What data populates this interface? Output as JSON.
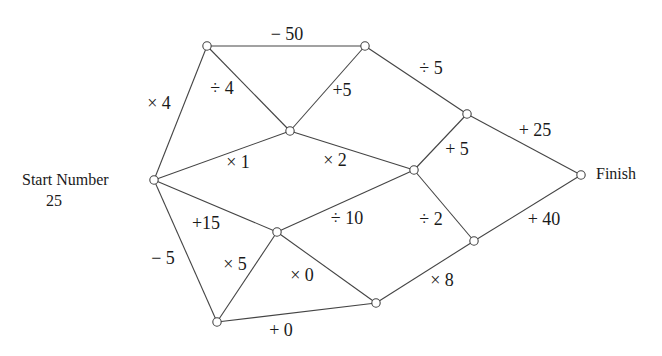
{
  "labels": {
    "start_title": "Start Number",
    "start_value": "25",
    "finish": "Finish"
  },
  "nodes": [
    {
      "id": "start",
      "x": 154,
      "y": 180
    },
    {
      "id": "A",
      "x": 207,
      "y": 46
    },
    {
      "id": "B",
      "x": 365,
      "y": 46
    },
    {
      "id": "C",
      "x": 290,
      "y": 131
    },
    {
      "id": "D",
      "x": 467,
      "y": 114
    },
    {
      "id": "E",
      "x": 414,
      "y": 170
    },
    {
      "id": "finish",
      "x": 581,
      "y": 175
    },
    {
      "id": "F",
      "x": 277,
      "y": 232
    },
    {
      "id": "G",
      "x": 474,
      "y": 241
    },
    {
      "id": "H",
      "x": 217,
      "y": 322
    },
    {
      "id": "I",
      "x": 376,
      "y": 303
    }
  ],
  "edges": [
    {
      "from": "start",
      "to": "A",
      "op": "× 4",
      "lx": 159,
      "ly": 103
    },
    {
      "from": "A",
      "to": "B",
      "op": "− 50",
      "lx": 287,
      "ly": 34
    },
    {
      "from": "A",
      "to": "C",
      "op": "÷ 4",
      "lx": 222,
      "ly": 88
    },
    {
      "from": "B",
      "to": "C",
      "op": "+5",
      "lx": 342,
      "ly": 90
    },
    {
      "from": "B",
      "to": "D",
      "op": "÷ 5",
      "lx": 431,
      "ly": 68
    },
    {
      "from": "start",
      "to": "C",
      "op": "× 1",
      "lx": 238,
      "ly": 162
    },
    {
      "from": "C",
      "to": "E",
      "op": "× 2",
      "lx": 335,
      "ly": 160
    },
    {
      "from": "D",
      "to": "E",
      "op": "+ 5",
      "lx": 457,
      "ly": 149
    },
    {
      "from": "D",
      "to": "finish",
      "op": "+ 25",
      "lx": 535,
      "ly": 130
    },
    {
      "from": "start",
      "to": "F",
      "op": "+15",
      "lx": 206,
      "ly": 223
    },
    {
      "from": "F",
      "to": "E",
      "op": "÷ 10",
      "lx": 347,
      "ly": 218
    },
    {
      "from": "E",
      "to": "G",
      "op": "÷ 2",
      "lx": 431,
      "ly": 219
    },
    {
      "from": "G",
      "to": "finish",
      "op": "+ 40",
      "lx": 544,
      "ly": 219
    },
    {
      "from": "start",
      "to": "H",
      "op": "− 5",
      "lx": 163,
      "ly": 258
    },
    {
      "from": "H",
      "to": "F",
      "op": "× 5",
      "lx": 235,
      "ly": 264
    },
    {
      "from": "F",
      "to": "I",
      "op": "× 0",
      "lx": 302,
      "ly": 275
    },
    {
      "from": "H",
      "to": "I",
      "op": "+ 0",
      "lx": 281,
      "ly": 330
    },
    {
      "from": "I",
      "to": "G",
      "op": "× 8",
      "lx": 442,
      "ly": 280
    }
  ]
}
